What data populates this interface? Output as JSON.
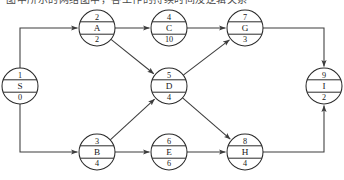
{
  "header": {
    "clipped_caption": "图中所示的网络图中，各工作的持续时间及逻辑关系"
  },
  "diagram": {
    "type": "network-diagram",
    "stroke_color": "#2b2b2b",
    "edge_color": "#3c3c3c",
    "node_fill": "#ffffff",
    "node_radius": 18,
    "nodes": [
      {
        "id": "S",
        "label": "S",
        "number": "1",
        "duration": "0",
        "cx": 20,
        "cy": 86
      },
      {
        "id": "A",
        "label": "A",
        "number": "2",
        "duration": "2",
        "cx": 97,
        "cy": 28
      },
      {
        "id": "C",
        "label": "C",
        "number": "4",
        "duration": "10",
        "cx": 169,
        "cy": 28
      },
      {
        "id": "G",
        "label": "G",
        "number": "7",
        "duration": "3",
        "cx": 245,
        "cy": 28
      },
      {
        "id": "D",
        "label": "D",
        "number": "5",
        "duration": "4",
        "cx": 169,
        "cy": 86
      },
      {
        "id": "I",
        "label": "I",
        "number": "9",
        "duration": "2",
        "cx": 324,
        "cy": 86
      },
      {
        "id": "B",
        "label": "B",
        "number": "3",
        "duration": "4",
        "cx": 97,
        "cy": 152
      },
      {
        "id": "E",
        "label": "E",
        "number": "6",
        "duration": "6",
        "cx": 169,
        "cy": 152
      },
      {
        "id": "H",
        "label": "H",
        "number": "8",
        "duration": "4",
        "cx": 245,
        "cy": 152
      }
    ],
    "edges": [
      {
        "from": "S",
        "to": "A",
        "style": "elbow"
      },
      {
        "from": "S",
        "to": "B",
        "style": "elbow"
      },
      {
        "from": "A",
        "to": "C",
        "style": "straight"
      },
      {
        "from": "A",
        "to": "D",
        "style": "straight"
      },
      {
        "from": "B",
        "to": "D",
        "style": "straight"
      },
      {
        "from": "B",
        "to": "E",
        "style": "straight"
      },
      {
        "from": "C",
        "to": "G",
        "style": "straight"
      },
      {
        "from": "D",
        "to": "G",
        "style": "straight"
      },
      {
        "from": "D",
        "to": "H",
        "style": "straight"
      },
      {
        "from": "E",
        "to": "H",
        "style": "straight"
      },
      {
        "from": "G",
        "to": "I",
        "style": "elbow"
      },
      {
        "from": "H",
        "to": "I",
        "style": "elbow"
      }
    ]
  }
}
